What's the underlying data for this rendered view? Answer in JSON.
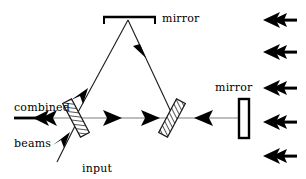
{
  "figure": {
    "type": "optics-ray-diagram",
    "background_color": "#ffffff",
    "line_color": "#000000",
    "beam_line_color": "#9a9a9a"
  },
  "labels": {
    "mirror_top": "mirror",
    "mirror_right": "mirror",
    "combined_beams_line1": "combined",
    "combined_beams_line2": "beams",
    "input_beam_line1": "input",
    "input_beam_line2": "beam"
  },
  "components": {
    "top_mirror": {
      "name": "mirror",
      "shape": "horizontal-bar-with-end-ticks",
      "x1": 103,
      "x2": 155,
      "y": 17
    },
    "right_mirror": {
      "name": "mirror",
      "shape": "vertical-rectangle",
      "x": 240,
      "y": 100,
      "width": 9,
      "height": 38
    },
    "left_beamsplitter": {
      "name": "beam-splitter",
      "shape": "hatched-parallelogram",
      "cx": 76,
      "cy": 118,
      "angle_deg": 62
    },
    "right_beamsplitter": {
      "name": "beam-splitter",
      "shape": "hatched-parallelogram",
      "cx": 172,
      "cy": 118,
      "angle_deg": 118
    }
  },
  "beams": {
    "horizontal_axis_y": 118,
    "input_beam": {
      "from": [
        58,
        160
      ],
      "to": [
        76,
        118
      ],
      "direction": "up-right",
      "arrows": 1
    },
    "combined_beams_output": {
      "from": [
        76,
        118
      ],
      "to": [
        12,
        118
      ],
      "direction": "left",
      "arrows": 1,
      "arrow_style": "barbed-double"
    },
    "lower_path": {
      "from": [
        76,
        118
      ],
      "to": [
        172,
        118
      ],
      "direction": "right",
      "arrows": 2
    },
    "upper_path_left_leg": {
      "from": [
        76,
        118
      ],
      "to": [
        128,
        19
      ],
      "direction": "up-right",
      "arrows": 1
    },
    "upper_path_right_leg": {
      "from": [
        128,
        19
      ],
      "to": [
        172,
        118
      ],
      "direction": "down-right",
      "arrows": 1
    },
    "to_right_mirror": {
      "from": [
        172,
        118
      ],
      "to": [
        240,
        118
      ],
      "direction": "right",
      "arrows": 1,
      "note": "arrow drawn pointing left toward beamsplitter"
    }
  },
  "incoming_arrows": {
    "count": 5,
    "direction": "left",
    "style": "barbed-arrow",
    "x_start": 296,
    "x_end": 263,
    "y_positions": [
      20,
      52,
      88,
      122,
      156
    ]
  }
}
